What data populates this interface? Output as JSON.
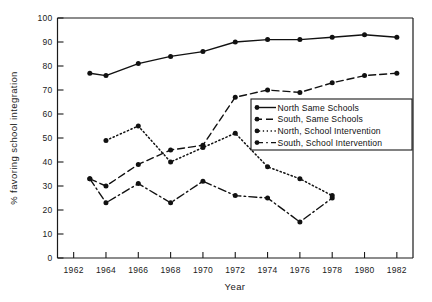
{
  "chart_data": {
    "type": "line",
    "title": "",
    "xlabel": "Year",
    "ylabel": "% favoring school integration",
    "xlim": [
      1961,
      1983
    ],
    "ylim": [
      0,
      100
    ],
    "grid": false,
    "legend_position": "center-right",
    "xticks": [
      1962,
      1964,
      1966,
      1968,
      1970,
      1972,
      1974,
      1976,
      1978,
      1980,
      1982
    ],
    "yticks": [
      0,
      10,
      20,
      30,
      40,
      50,
      60,
      70,
      80,
      90,
      100
    ],
    "series": [
      {
        "name": "North Same Schools",
        "style": "solid",
        "marker": "filled-circle",
        "x": [
          1963,
          1964,
          1966,
          1968,
          1970,
          1972,
          1974,
          1976,
          1978,
          1980,
          1982
        ],
        "values": [
          77,
          76,
          81,
          84,
          86,
          90,
          91,
          91,
          92,
          93,
          92
        ]
      },
      {
        "name": "South, Same Schools",
        "style": "dashed",
        "marker": "filled-circle",
        "x": [
          1963,
          1964,
          1966,
          1968,
          1970,
          1972,
          1974,
          1976,
          1978,
          1980,
          1982
        ],
        "values": [
          33,
          30,
          39,
          45,
          47,
          67,
          70,
          69,
          73,
          76,
          77
        ]
      },
      {
        "name": "North, School Intervention",
        "style": "dotted",
        "marker": "filled-circle",
        "x": [
          1964,
          1966,
          1968,
          1970,
          1972,
          1974,
          1976,
          1978
        ],
        "values": [
          49,
          55,
          40,
          46,
          52,
          38,
          33,
          26
        ]
      },
      {
        "name": "South, School Intervention",
        "style": "dashdot",
        "marker": "filled-circle",
        "x": [
          1963,
          1964,
          1966,
          1968,
          1970,
          1972,
          1974,
          1976,
          1978
        ],
        "values": [
          33,
          23,
          31,
          23,
          32,
          26,
          25,
          15,
          25
        ]
      }
    ],
    "colors": {
      "axis": "#1a1a1a",
      "lines": "#111111",
      "background": "#ffffff"
    }
  },
  "axes": {
    "y_title": "% favoring school integration",
    "x_title": "Year",
    "y_tick_labels": [
      "100",
      "90",
      "80",
      "70",
      "60",
      "50",
      "40",
      "30",
      "20",
      "10",
      "0"
    ],
    "x_tick_labels": [
      "1962",
      "1964",
      "1966",
      "1968",
      "1970",
      "1972",
      "1974",
      "1976",
      "1978",
      "1980",
      "1982"
    ]
  },
  "legend": {
    "items": [
      {
        "label": "North Same Schools",
        "style": "solid"
      },
      {
        "label": "South, Same Schools",
        "style": "dashed"
      },
      {
        "label": "North, School Intervention",
        "style": "dotted"
      },
      {
        "label": "South, School Intervention",
        "style": "dashdot"
      }
    ]
  }
}
